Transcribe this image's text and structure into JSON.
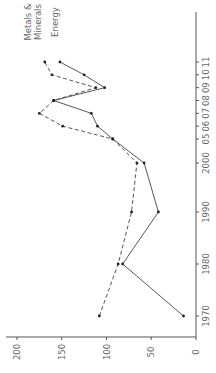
{
  "chart_data": {
    "type": "line",
    "orientation": "rotated-90-ccw",
    "title": "",
    "xlabel": "",
    "ylabel": "",
    "x": [
      "1970",
      "1980",
      "1990",
      "2000",
      "05",
      "06",
      "07",
      "08",
      "09",
      "10",
      "11"
    ],
    "x_years": [
      1970,
      1980,
      1990,
      2000,
      2005,
      2006,
      2007,
      2008,
      2009,
      2010,
      2011
    ],
    "ylim": [
      0,
      200
    ],
    "yticks": [
      "0",
      "50",
      "100",
      "150",
      "200"
    ],
    "grid": false,
    "series": [
      {
        "name": "Metals & Minerals",
        "label_lines": [
          "Metals &",
          "Minerals"
        ],
        "style": "dashed",
        "values": [
          108,
          87,
          72,
          66,
          93,
          149,
          175,
          159,
          112,
          161,
          169
        ]
      },
      {
        "name": "Energy",
        "label_lines": [
          "Energy"
        ],
        "style": "solid",
        "values": [
          14,
          82,
          42,
          58,
          93,
          110,
          117,
          159,
          102,
          125,
          152
        ]
      }
    ]
  }
}
